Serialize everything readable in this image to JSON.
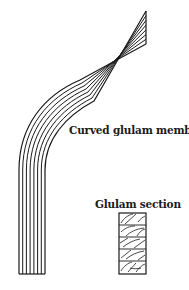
{
  "diagram": {
    "labels": {
      "curved_member": "Curved glulam member",
      "section": "Glulam section"
    },
    "curved_member": {
      "lamination_count": 7,
      "line_color": "#1a1a1a",
      "fill_color": "#ffffff"
    },
    "section": {
      "lamination_count": 5,
      "line_color": "#1a1a1a"
    }
  }
}
